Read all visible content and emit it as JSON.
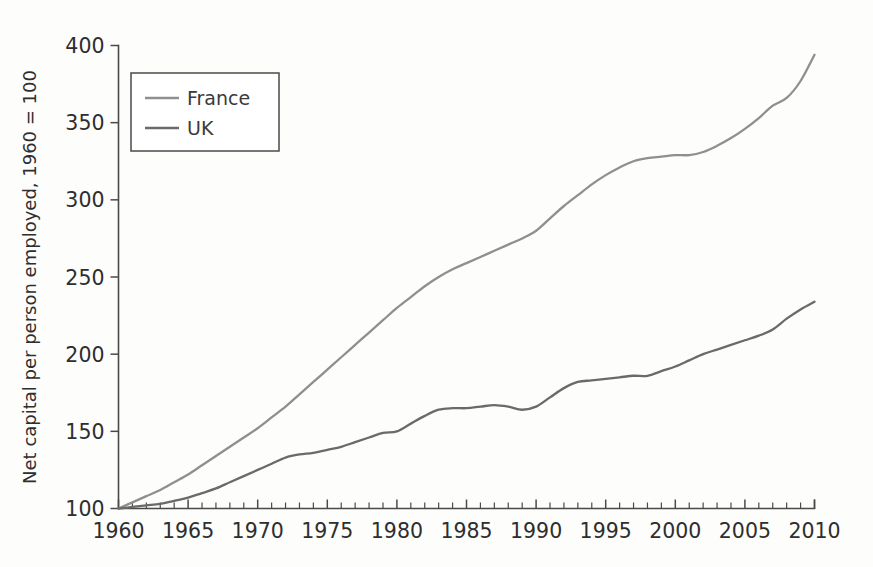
{
  "figure": {
    "background_color": "#fdfdfc",
    "axis_color": "#4a4a4a"
  },
  "chart_data": {
    "type": "line",
    "title": "",
    "subtitle": "",
    "xlabel": "",
    "ylabel": "Net capital per person employed, 1960 = 100",
    "xlim": [
      1960,
      2010
    ],
    "ylim": [
      100,
      400
    ],
    "xticks": [
      1960,
      1965,
      1970,
      1975,
      1980,
      1985,
      1990,
      1995,
      2000,
      2005,
      2010
    ],
    "xtick_labels": [
      "1960",
      "1965",
      "1970",
      "1975",
      "1980",
      "1985",
      "1990",
      "1995",
      "2000",
      "2005",
      "2010"
    ],
    "yticks": [
      100,
      150,
      200,
      250,
      300,
      350,
      400
    ],
    "ytick_labels": [
      "100",
      "150",
      "200",
      "250",
      "300",
      "350",
      "400"
    ],
    "minor_xtick_step": 1,
    "grid": false,
    "legend_position": "upper-left-inset",
    "x": [
      1960,
      1961,
      1962,
      1963,
      1964,
      1965,
      1966,
      1967,
      1968,
      1969,
      1970,
      1971,
      1972,
      1973,
      1974,
      1975,
      1976,
      1977,
      1978,
      1979,
      1980,
      1981,
      1982,
      1983,
      1984,
      1985,
      1986,
      1987,
      1988,
      1989,
      1990,
      1991,
      1992,
      1993,
      1994,
      1995,
      1996,
      1997,
      1998,
      1999,
      2000,
      2001,
      2002,
      2003,
      2004,
      2005,
      2006,
      2007,
      2008,
      2009,
      2010
    ],
    "series": [
      {
        "name": "France",
        "color": "#8f8f8f",
        "values": [
          100,
          104,
          108,
          112,
          117,
          122,
          128,
          134,
          140,
          146,
          152,
          159,
          166,
          174,
          182,
          190,
          198,
          206,
          214,
          222,
          230,
          237,
          244,
          250,
          255,
          259,
          263,
          267,
          271,
          275,
          280,
          288,
          296,
          303,
          310,
          316,
          321,
          325,
          327,
          328,
          329,
          329,
          331,
          335,
          340,
          346,
          353,
          361,
          366,
          377,
          394
        ]
      },
      {
        "name": "UK",
        "color": "#6a6a6a",
        "values": [
          100,
          101,
          102,
          103,
          105,
          107,
          110,
          113,
          117,
          121,
          125,
          129,
          133,
          135,
          136,
          138,
          140,
          143,
          146,
          149,
          150,
          155,
          160,
          164,
          165,
          165,
          166,
          167,
          166,
          164,
          166,
          172,
          178,
          182,
          183,
          184,
          185,
          186,
          186,
          189,
          192,
          196,
          200,
          203,
          206,
          209,
          212,
          216,
          223,
          229,
          234
        ]
      }
    ]
  },
  "legend": {
    "items": [
      {
        "label": "France",
        "color": "#8f8f8f"
      },
      {
        "label": "UK",
        "color": "#6a6a6a"
      }
    ]
  }
}
